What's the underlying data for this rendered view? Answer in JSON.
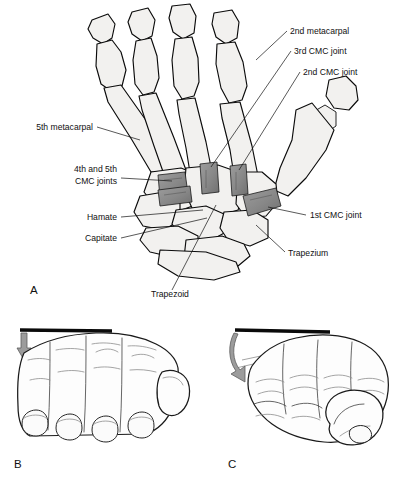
{
  "figure": {
    "background_color": "#ffffff",
    "bone_fill": "#f2f1ef",
    "outline_color": "#0b0b0b",
    "joint_marker_color": "#8a8a8a",
    "arrow_color": "#9c9c9c"
  },
  "panels": [
    {
      "letter": "A",
      "name": "dorsal-bone-anatomy",
      "description": "Dorsal view of hand skeleton with carpometacarpal joints highlighted"
    },
    {
      "letter": "B",
      "name": "flat-hand-view",
      "description": "Hand flat against a surface with downward arrow"
    },
    {
      "letter": "C",
      "name": "fist-hand-view",
      "description": "Closed fist against a surface with curved arrow"
    }
  ],
  "labels": [
    {
      "id": "second-metacarpal",
      "text": "2nd metacarpal",
      "x": 290,
      "y": 34,
      "anchor": "start"
    },
    {
      "id": "third-cmc-joint",
      "text": "3rd CMC joint",
      "x": 294,
      "y": 54,
      "anchor": "start"
    },
    {
      "id": "second-cmc-joint",
      "text": "2nd CMC joint",
      "x": 303,
      "y": 75,
      "anchor": "start"
    },
    {
      "id": "fifth-metacarpal",
      "text": "5th metacarpal",
      "x": 93,
      "y": 130,
      "anchor": "end"
    },
    {
      "id": "fourth-fifth-cmc-line1",
      "text": "4th and 5th",
      "x": 117,
      "y": 172,
      "anchor": "end"
    },
    {
      "id": "fourth-fifth-cmc-line2",
      "text": "CMC joints",
      "x": 117,
      "y": 184,
      "anchor": "end"
    },
    {
      "id": "hamate",
      "text": "Hamate",
      "x": 117,
      "y": 220,
      "anchor": "end"
    },
    {
      "id": "capitate",
      "text": "Capitate",
      "x": 117,
      "y": 241,
      "anchor": "end"
    },
    {
      "id": "first-cmc-joint",
      "text": "1st CMC joint",
      "x": 310,
      "y": 218,
      "anchor": "start"
    },
    {
      "id": "trapezium",
      "text": "Trapezium",
      "x": 288,
      "y": 256,
      "anchor": "start"
    },
    {
      "id": "trapezoid",
      "text": "Trapezoid",
      "x": 151,
      "y": 297,
      "anchor": "start"
    }
  ],
  "leader_lines": [
    {
      "id": "leader-second-metacarpal",
      "d": "M287,31 L256,60"
    },
    {
      "id": "leader-third-cmc-joint",
      "d": "M291,51 L211,167"
    },
    {
      "id": "leader-second-cmc-joint",
      "d": "M300,72 L239,170"
    },
    {
      "id": "leader-fifth-metacarpal",
      "d": "M97,127 L140,140"
    },
    {
      "id": "leader-fourth-fifth-cmc",
      "d": "M121,178 L172,181"
    },
    {
      "id": "leader-hamate",
      "d": "M121,217 L203,210"
    },
    {
      "id": "leader-capitate",
      "d": "M121,238 L207,218"
    },
    {
      "id": "leader-first-cmc-joint",
      "d": "M306,215 L268,207"
    },
    {
      "id": "leader-trapezium",
      "d": "M285,252 L256,225"
    },
    {
      "id": "leader-trapezoid",
      "d": "M172,290 L216,205"
    }
  ],
  "joint_markers": [
    {
      "id": "cmc-marker-4-5",
      "fill": "#8a8a8a"
    },
    {
      "id": "cmc-marker-4",
      "fill": "#8f8f8f"
    },
    {
      "id": "cmc-marker-3",
      "fill": "#868686"
    },
    {
      "id": "cmc-marker-2",
      "fill": "#8c8c8c"
    },
    {
      "id": "cmc-marker-1",
      "fill": "#8a8a8a"
    }
  ]
}
